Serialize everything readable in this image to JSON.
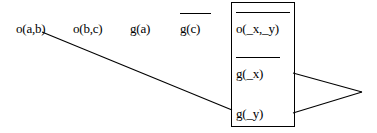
{
  "diagram": {
    "background_color": "#ffffff",
    "ink_color": "#000000",
    "goal_row": [
      {
        "id": "goal-1",
        "text": "o(a,b)",
        "overlined": false,
        "x": 16,
        "baseline": 33
      },
      {
        "id": "goal-2",
        "text": "o(b,c)",
        "overlined": false,
        "x": 73,
        "baseline": 33
      },
      {
        "id": "goal-3",
        "text": "g(a)",
        "overlined": false,
        "x": 130,
        "baseline": 33
      },
      {
        "id": "goal-4",
        "text": "g(c)",
        "overlined": true,
        "x": 180,
        "baseline": 33
      }
    ],
    "clause_box": {
      "x": 231,
      "y": 2,
      "width": 64,
      "height": 125,
      "literals": [
        {
          "id": "clause-literal-1",
          "text": "o(_x,_y)",
          "overlined": true,
          "baseline": 33
        },
        {
          "id": "clause-literal-2",
          "text": "g(_x)",
          "overlined": true,
          "baseline": 78
        },
        {
          "id": "clause-literal-3",
          "text": "g(_y)",
          "overlined": false,
          "baseline": 118
        }
      ]
    },
    "connectors": [
      {
        "id": "connector-goal-to-clause",
        "x1": 42,
        "y1": 32,
        "x2": 232,
        "y2": 110
      },
      {
        "id": "connector-clause-upper-to-apex",
        "x1": 293,
        "y1": 73,
        "x2": 362,
        "y2": 92
      },
      {
        "id": "connector-clause-lower-to-apex",
        "x1": 293,
        "y1": 113,
        "x2": 362,
        "y2": 92
      }
    ]
  }
}
